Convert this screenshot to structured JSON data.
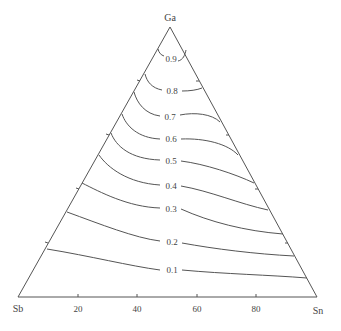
{
  "diagram": {
    "type": "ternary-contour",
    "vertices": {
      "top": "Ga",
      "bottom_left": "Sb",
      "bottom_right": "Sn"
    },
    "bottom_axis_ticks": [
      "20",
      "40",
      "60",
      "80"
    ],
    "contour_labels": [
      "0.9",
      "0.8",
      "0.7",
      "0.6",
      "0.5",
      "0.4",
      "0.3",
      "0.2",
      "0.1"
    ]
  }
}
